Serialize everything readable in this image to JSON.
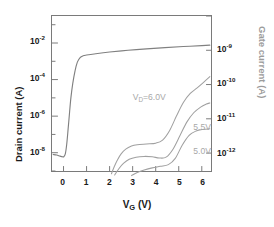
{
  "chart_data": {
    "type": "line",
    "title": "",
    "xlabel": "V_G (V)",
    "xlabel_main": "V",
    "xlabel_sub": "G",
    "xlabel_unit": " (V)",
    "ylabel_left": "Drain current (A)",
    "ylabel_right": "Gate current (A)",
    "xlim": [
      -0.5,
      6.4
    ],
    "xticks": [
      0,
      1,
      2,
      3,
      4,
      5,
      6
    ],
    "xtick_labels": [
      "0",
      "1",
      "2",
      "3",
      "4",
      "5",
      "6"
    ],
    "left_axis": {
      "scale": "log",
      "ylim": [
        1e-09,
        0.3
      ],
      "tick_exponents": [
        -2,
        -4,
        -6,
        -8
      ],
      "tick_labels": [
        "10-2",
        "10-4",
        "10-6",
        "10-8"
      ],
      "minor_ticks": true
    },
    "right_axis": {
      "scale": "log",
      "ylim": [
        3e-13,
        1e-08
      ],
      "tick_exponents": [
        -9,
        -10,
        -11,
        -12
      ],
      "tick_labels": [
        "10-9",
        "10-10",
        "10-11",
        "10-12"
      ],
      "color": "#1a1a1a"
    },
    "grid": false,
    "legend": "inline annotations",
    "series": [
      {
        "name": "Drain current",
        "axis": "left",
        "color": "#808080",
        "annotation": null,
        "points": [
          [
            -0.45,
            8e-09
          ],
          [
            -0.3,
            7.5e-09
          ],
          [
            -0.15,
            6.5e-09
          ],
          [
            -0.05,
            6e-09
          ],
          [
            0.02,
            6.2e-09
          ],
          [
            0.08,
            9e-09
          ],
          [
            0.14,
            3e-08
          ],
          [
            0.2,
            2e-07
          ],
          [
            0.26,
            1.5e-06
          ],
          [
            0.32,
            1e-05
          ],
          [
            0.4,
            6e-05
          ],
          [
            0.5,
            0.0003
          ],
          [
            0.6,
            0.0009
          ],
          [
            0.72,
            0.0016
          ],
          [
            0.85,
            0.002
          ],
          [
            1.0,
            0.0022
          ],
          [
            1.4,
            0.0026
          ],
          [
            2.0,
            0.0032
          ],
          [
            2.8,
            0.004
          ],
          [
            3.6,
            0.0048
          ],
          [
            4.4,
            0.0056
          ],
          [
            5.2,
            0.0064
          ],
          [
            6.0,
            0.0072
          ],
          [
            6.35,
            0.0076
          ]
        ]
      },
      {
        "name": "VD=6.0V gate current",
        "axis": "right",
        "color": "#a0a0a0",
        "annotation": "V_D=6.0V",
        "annotation_main": "V",
        "annotation_sub": "D",
        "annotation_rest": "=6.0V",
        "points": [
          [
            2.08,
            2.5e-13
          ],
          [
            2.2,
            4e-13
          ],
          [
            2.35,
            6.5e-13
          ],
          [
            2.5,
            9.5e-13
          ],
          [
            2.7,
            1.3e-12
          ],
          [
            2.95,
            1.6e-12
          ],
          [
            3.2,
            1.75e-12
          ],
          [
            3.6,
            1.85e-12
          ],
          [
            4.0,
            1.95e-12
          ],
          [
            4.3,
            2.4e-12
          ],
          [
            4.6,
            4.5e-12
          ],
          [
            4.9,
            1.2e-11
          ],
          [
            5.2,
            3e-11
          ],
          [
            5.5,
            5.5e-11
          ],
          [
            5.8,
            8e-11
          ],
          [
            6.1,
            1.2e-10
          ],
          [
            6.35,
            1.7e-10
          ]
        ]
      },
      {
        "name": "VD=5.5V gate current",
        "axis": "right",
        "color": "#a0a0a0",
        "annotation": "5.5V",
        "points": [
          [
            2.22,
            2.3e-13
          ],
          [
            2.4,
            3.5e-13
          ],
          [
            2.6,
            5e-13
          ],
          [
            2.85,
            6.6e-13
          ],
          [
            3.15,
            7.6e-13
          ],
          [
            3.5,
            8e-13
          ],
          [
            3.85,
            7.8e-13
          ],
          [
            4.15,
            7.2e-13
          ],
          [
            4.45,
            7.6e-13
          ],
          [
            4.75,
            1.3e-12
          ],
          [
            5.05,
            3.2e-12
          ],
          [
            5.35,
            8e-12
          ],
          [
            5.65,
            1.5e-11
          ],
          [
            5.95,
            2.2e-11
          ],
          [
            6.2,
            2.7e-11
          ],
          [
            6.35,
            2.9e-11
          ]
        ]
      },
      {
        "name": "VD=5.0V gate current",
        "axis": "right",
        "color": "#a0a0a0",
        "annotation": "5.0V",
        "points": [
          [
            2.95,
            2.2e-13
          ],
          [
            3.2,
            2.7e-13
          ],
          [
            3.5,
            3.2e-13
          ],
          [
            3.85,
            3.7e-13
          ],
          [
            4.2,
            4.1e-13
          ],
          [
            4.55,
            4.6e-13
          ],
          [
            4.85,
            7e-13
          ],
          [
            5.15,
            1.7e-12
          ],
          [
            5.45,
            3.3e-12
          ],
          [
            5.75,
            4.4e-12
          ],
          [
            6.05,
            4.9e-12
          ],
          [
            6.35,
            5.1e-12
          ]
        ]
      }
    ],
    "annotations": [
      {
        "text": "V_D=6.0V",
        "x": 3.0,
        "y_px": 92
      },
      {
        "text": "5.5V",
        "x": 5.6,
        "y_px": 122
      },
      {
        "text": "5.0V",
        "x": 5.6,
        "y_px": 146
      }
    ]
  },
  "axis": {
    "left_ticks": [
      {
        "mantissa": "10",
        "exp": "-2"
      },
      {
        "mantissa": "10",
        "exp": "-4"
      },
      {
        "mantissa": "10",
        "exp": "-6"
      },
      {
        "mantissa": "10",
        "exp": "-8"
      }
    ],
    "right_ticks": [
      {
        "mantissa": "10",
        "exp": "-9"
      },
      {
        "mantissa": "10",
        "exp": "-10"
      },
      {
        "mantissa": "10",
        "exp": "-11"
      },
      {
        "mantissa": "10",
        "exp": "-12"
      }
    ],
    "x_ticks": [
      "0",
      "1",
      "2",
      "3",
      "4",
      "5",
      "6"
    ]
  },
  "labels": {
    "y_left": "Drain current (A)",
    "y_right": "Gate current (A)",
    "x_main": "V",
    "x_sub": "G",
    "x_unit": " (V)",
    "ann_vd_main": "V",
    "ann_vd_sub": "D",
    "ann_vd_rest": "=6.0V",
    "ann_55": "5.5V",
    "ann_50": "5.0V"
  },
  "colors": {
    "frame": "#7a7a7a",
    "curve": "#808080",
    "gate_curve": "#a0a0a0",
    "annotation": "#a8a8a8",
    "text": "#1a1a1a",
    "right_title": "#9b9b9b"
  }
}
